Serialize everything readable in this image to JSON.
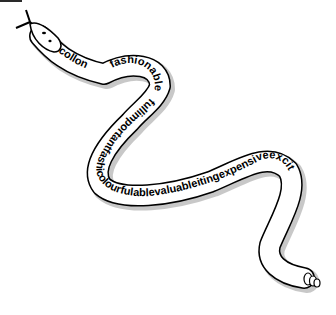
{
  "illustration": {
    "type": "snake word-art",
    "colors": {
      "outline": "#000000",
      "fill": "#ffffff",
      "shadow": "#9a9a9a",
      "text": "#000000"
    },
    "segments": {
      "neck_text": "collon",
      "loop_text": "fashionable",
      "body_text": "fullimportantfashicolourfulablevaluableitingexpensiveexcit"
    },
    "parts": [
      "tongue",
      "head",
      "eyes",
      "body",
      "rattle-tail"
    ]
  }
}
